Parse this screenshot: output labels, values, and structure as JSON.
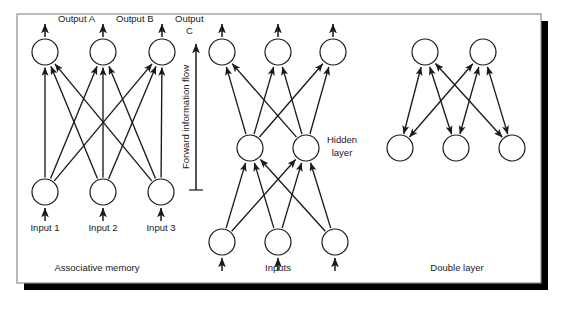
{
  "figure": {
    "background": "#ffffff",
    "frame": {
      "x": 17,
      "y": 14,
      "width": 524,
      "height": 269,
      "border_color": "#8c8c8c",
      "fill": "#ffffff",
      "shadow_color": "#000000",
      "shadow_offset": 7
    },
    "stroke_color": "#1a1a1a",
    "node_fill": "#ffffff",
    "node_radius": 13,
    "label_color": "#1a1a1a",
    "font_size": 9.5
  },
  "panels": [
    {
      "id": "associative-memory",
      "caption": "Associative memory",
      "caption_pos": {
        "x": 97,
        "y": 271
      },
      "layers": [
        {
          "id": "outputs",
          "y": 52,
          "nodes": [
            {
              "id": "out-a",
              "x": 45,
              "label": "Output A",
              "label_x": 58,
              "label_y": 22
            },
            {
              "id": "out-b",
              "x": 103,
              "label": "Output B",
              "label_x": 116,
              "label_y": 22
            },
            {
              "id": "out-c",
              "x": 162,
              "label": "Output",
              "label_x": 175,
              "label_y": 22,
              "label2": "C",
              "label2_x": 186,
              "label2_y": 34
            }
          ]
        },
        {
          "id": "inputs",
          "y": 192,
          "nodes": [
            {
              "id": "in-1",
              "x": 45,
              "label": "Input 1",
              "label_x": 45,
              "label_y": 231
            },
            {
              "id": "in-2",
              "x": 103,
              "label": "Input 2",
              "label_x": 103,
              "label_y": 231
            },
            {
              "id": "in-3",
              "x": 161,
              "label": "Input 3",
              "label_x": 161,
              "label_y": 231
            }
          ]
        }
      ],
      "connections": "fully-connected 3 inputs to 3 outputs, single-headed arrows upward",
      "external_arrows": {
        "top": "up out of outputs",
        "bottom": "up into inputs"
      }
    },
    {
      "id": "multilayer-perceptron",
      "caption": "Inputs",
      "caption_pos": {
        "x": 278,
        "y": 271
      },
      "extra_label": {
        "text": "Hidden",
        "x": 342,
        "y": 143,
        "text2": "layer",
        "x2": 342,
        "y2": 156
      },
      "layers": [
        {
          "id": "outputs",
          "y": 52,
          "nodes": [
            {
              "id": "m-out-1",
              "x": 222
            },
            {
              "id": "m-out-2",
              "x": 278
            },
            {
              "id": "m-out-3",
              "x": 333
            }
          ]
        },
        {
          "id": "hidden",
          "y": 148,
          "nodes": [
            {
              "id": "m-hid-1",
              "x": 250
            },
            {
              "id": "m-hid-2",
              "x": 306
            }
          ]
        },
        {
          "id": "inputs",
          "y": 242,
          "nodes": [
            {
              "id": "m-in-1",
              "x": 222
            },
            {
              "id": "m-in-2",
              "x": 278
            },
            {
              "id": "m-in-3",
              "x": 335
            }
          ]
        }
      ],
      "connections": "inputs fully connected to hidden, hidden fully connected to outputs, single-headed arrows upward"
    },
    {
      "id": "double-layer",
      "caption": "Double layer",
      "caption_pos": {
        "x": 457,
        "y": 271
      },
      "layers": [
        {
          "id": "upper",
          "y": 52,
          "nodes": [
            {
              "id": "d-up-1",
              "x": 425
            },
            {
              "id": "d-up-2",
              "x": 483
            }
          ]
        },
        {
          "id": "lower",
          "y": 148,
          "nodes": [
            {
              "id": "d-low-1",
              "x": 400
            },
            {
              "id": "d-low-2",
              "x": 456
            },
            {
              "id": "d-low-3",
              "x": 512
            }
          ]
        }
      ],
      "connections": "fully connected with double-headed (bidirectional) arrows"
    }
  ],
  "annotations": {
    "flow_arrow": {
      "text": "Forward information flow",
      "line_x": 196,
      "line_top": 44,
      "line_bottom": 190,
      "text_x": 189,
      "text_y": 117,
      "rotation": -90,
      "bar_x1": 189,
      "bar_x2": 203,
      "bar_y": 190
    }
  }
}
